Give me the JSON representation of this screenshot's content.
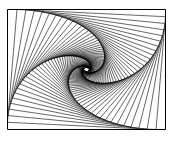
{
  "figure": {
    "outer_rect": {
      "x0": 7.5,
      "y0": 9.5,
      "x1": 165.5,
      "y1": 129.5
    },
    "iterations": 60,
    "step_fraction": 0.06,
    "direction": "clockwise",
    "stroke_color": "#000000",
    "stroke_width": 0.6,
    "background": "#ffffff"
  }
}
